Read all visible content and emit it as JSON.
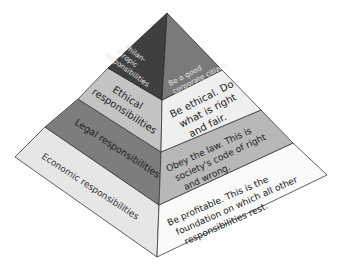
{
  "colors": {
    "philanthropic_left": "#3f3f3f",
    "philanthropic_right": "#7a7a7a",
    "ethical_left": "#c4c4c4",
    "ethical_right": "#efefef",
    "legal_left": "#7d7d7d",
    "legal_right": "#b8b8b8",
    "economic_left": "#e6e6e6",
    "economic_right": "#fafafa",
    "edge": "#3a3a3a"
  },
  "layers": [
    {
      "name": "philanthropic",
      "left_label": [
        "Philan-",
        "thropic",
        "responsibilities"
      ],
      "right_label": [
        "Be a good",
        "corporate citizen."
      ]
    },
    {
      "name": "ethical",
      "left_label": [
        "Ethical",
        "responsibilities"
      ],
      "right_label": [
        "Be ethical. Do",
        "what is right",
        "and fair."
      ]
    },
    {
      "name": "legal",
      "left_label": [
        "Legal responsibilities"
      ],
      "right_label": [
        "Obey the law. This is",
        "society's code of right",
        "and wrong."
      ]
    },
    {
      "name": "economic",
      "left_label": [
        "Economic responsibilities"
      ],
      "right_label": [
        "Be profitable. This is the",
        "foundation on which all other",
        "responsibilities rest."
      ]
    }
  ]
}
